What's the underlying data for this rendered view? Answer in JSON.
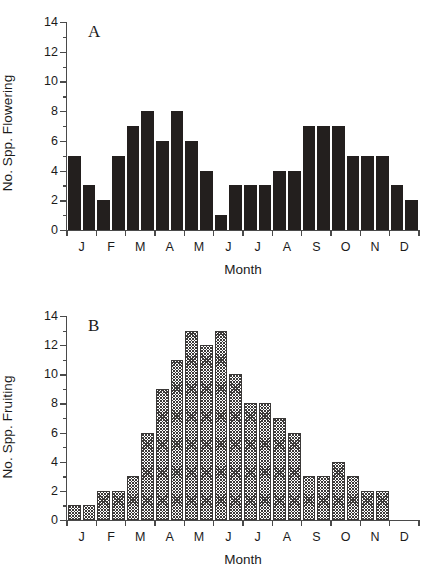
{
  "figure": {
    "panels": [
      {
        "letter": "A",
        "ylabel": "No. Spp. Flowering",
        "xlabel": "Month"
      },
      {
        "letter": "B",
        "ylabel": "No. Spp. Fruiting",
        "xlabel": "Month"
      }
    ]
  },
  "chart_data": [
    {
      "type": "bar",
      "title": "A",
      "xlabel": "Month",
      "ylabel": "No. Spp. Flowering",
      "ylim": [
        0,
        14
      ],
      "ytick_labels": [
        "0",
        "2",
        "4",
        "6",
        "8",
        "10",
        "12",
        "14"
      ],
      "ytick_values": [
        0,
        2,
        4,
        6,
        8,
        10,
        12,
        14
      ],
      "ytick_minor_step": 1,
      "grid": false,
      "legend": "none",
      "bar_fill": "solid-black",
      "categories": [
        "J",
        "F",
        "M",
        "A",
        "M",
        "J",
        "J",
        "A",
        "S",
        "O",
        "N",
        "D"
      ],
      "bars_per_category": 2,
      "x": [
        "J-1",
        "J-2",
        "F-1",
        "F-2",
        "M-1",
        "M-2",
        "A-1",
        "A-2",
        "M-1",
        "M-2",
        "J-1",
        "J-2",
        "J-1",
        "J-2",
        "A-1",
        "A-2",
        "S-1",
        "S-2",
        "O-1",
        "O-2",
        "N-1",
        "N-2",
        "D-1",
        "D-2"
      ],
      "values": [
        5,
        3,
        2,
        5,
        7,
        8,
        6,
        8,
        6,
        4,
        1,
        3,
        3,
        3,
        4,
        4,
        7,
        7,
        7,
        5,
        5,
        5,
        3,
        2
      ]
    },
    {
      "type": "bar",
      "title": "B",
      "xlabel": "Month",
      "ylabel": "No. Spp. Fruiting",
      "ylim": [
        0,
        14
      ],
      "ytick_labels": [
        "0",
        "2",
        "4",
        "6",
        "8",
        "10",
        "12",
        "14"
      ],
      "ytick_values": [
        0,
        2,
        4,
        6,
        8,
        10,
        12,
        14
      ],
      "ytick_minor_step": 1,
      "grid": false,
      "legend": "none",
      "bar_fill": "diagonal-crosshatch",
      "categories": [
        "J",
        "F",
        "M",
        "A",
        "M",
        "J",
        "J",
        "A",
        "S",
        "O",
        "N",
        "D"
      ],
      "bars_per_category": 2,
      "x": [
        "J-1",
        "J-2",
        "F-1",
        "F-2",
        "M-1",
        "M-2",
        "A-1",
        "A-2",
        "M-1",
        "M-2",
        "J-1",
        "J-2",
        "J-1",
        "J-2",
        "A-1",
        "A-2",
        "S-1",
        "S-2",
        "O-1",
        "O-2",
        "N-1",
        "N-2",
        "D-1",
        "D-2"
      ],
      "values": [
        1,
        1,
        2,
        2,
        3,
        6,
        9,
        11,
        13,
        12,
        13,
        10,
        8,
        8,
        7,
        6,
        3,
        3,
        4,
        3,
        2,
        2,
        0,
        0
      ]
    }
  ]
}
